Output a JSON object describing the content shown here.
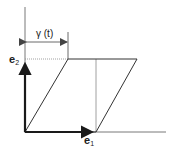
{
  "diagram": {
    "type": "shear-deformation",
    "labels": {
      "shear": "γ (t)",
      "e1": {
        "base": "e",
        "sub": "1"
      },
      "e2": {
        "base": "e",
        "sub": "2"
      }
    },
    "colors": {
      "line": "#333333",
      "vector": "#1a1a1a",
      "dotted": "#777777",
      "background": "#ffffff"
    }
  }
}
